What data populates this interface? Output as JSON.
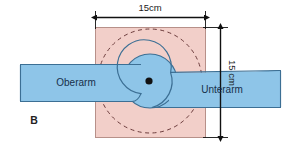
{
  "figure": {
    "panel_label": "B",
    "colors": {
      "pad_fill": "#f2cfc9",
      "pad_stroke": "#b08a84",
      "arm_fill": "#8ec5e8",
      "arm_stroke": "#3c6f94",
      "dashed_circle": "#6b3b3b",
      "dimension_line": "#111111",
      "pivot_dot": "#111111",
      "background": "#ffffff"
    }
  },
  "dimensions": {
    "width": {
      "label": "15cm",
      "value": 15,
      "unit": "cm",
      "orientation": "horizontal"
    },
    "height": {
      "label": "15 cm",
      "value": 15,
      "unit": "cm",
      "orientation": "vertical"
    }
  },
  "parts": {
    "upper_arm": {
      "label": "Oberarm"
    },
    "forearm": {
      "label": "Unterarm"
    },
    "pivot": {
      "name": "elbow-joint-center"
    },
    "pad": {
      "name": "square-treatment-field"
    },
    "dashed_circle": {
      "name": "rotation-range-circle"
    }
  }
}
